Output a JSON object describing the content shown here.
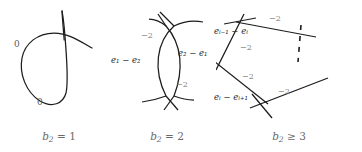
{
  "figure": {
    "panels": [
      {
        "id": "panel-1",
        "caption": "b₂ = 1",
        "caption_parts": {
          "symbol": "b",
          "subscript": "2",
          "relation": "=",
          "value": "1"
        },
        "shape": "nodal-cubic-loop",
        "labels": [
          {
            "name": "self-intersection-left",
            "text": "0"
          },
          {
            "name": "self-intersection-bottom",
            "text": "0"
          }
        ]
      },
      {
        "id": "panel-2",
        "caption": "b₂ = 2",
        "caption_parts": {
          "symbol": "b",
          "subscript": "2",
          "relation": "=",
          "value": "2"
        },
        "shape": "two-crossing-arcs-lens",
        "labels": [
          {
            "name": "divisor-left",
            "text": "e₁ − e₂"
          },
          {
            "name": "divisor-right",
            "text": "e₂ − e₁"
          },
          {
            "name": "self-intersection-upper",
            "text": "−2"
          },
          {
            "name": "self-intersection-lower",
            "text": "−2"
          }
        ]
      },
      {
        "id": "panel-3",
        "caption": "b₂ ≥ 3",
        "caption_parts": {
          "symbol": "b",
          "subscript": "2",
          "relation": "≥",
          "value": "3"
        },
        "shape": "polygon-chain-with-dashes",
        "labels": [
          {
            "name": "divisor-upper-left",
            "text": "eᵢ₋₁ − eᵢ"
          },
          {
            "name": "divisor-lower-left",
            "text": "eᵢ − eᵢ₊₁"
          },
          {
            "name": "self-intersection-top",
            "text": "−2"
          },
          {
            "name": "self-intersection-left-upper",
            "text": "−2"
          },
          {
            "name": "self-intersection-left-lower",
            "text": "−2"
          },
          {
            "name": "self-intersection-bottom",
            "text": "−2"
          }
        ],
        "continuation": "dashed-vertical-ellipsis"
      }
    ],
    "colors": {
      "curve": "#1c1c1c",
      "label_gray": "#6f6f6f",
      "number_gray": "#7a7a7a",
      "caption_gray": "#6a6a6a",
      "background": "#ffffff"
    }
  }
}
